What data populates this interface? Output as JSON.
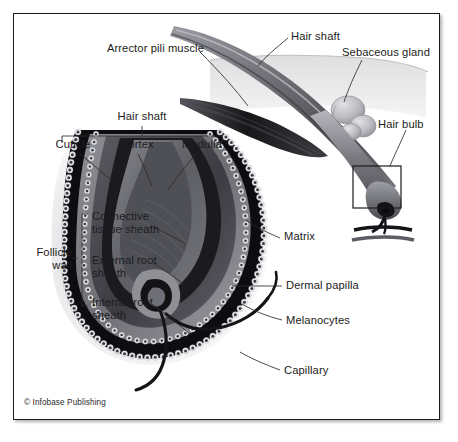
{
  "figure": {
    "credit": "© Infobase Publishing",
    "frame_color": "#1b1b1f",
    "background": "#ffffff",
    "text_color": "#1c1c20"
  },
  "labels": {
    "arrector_pili_muscle": "Arrector pili muscle",
    "hair_shaft_top": "Hair shaft",
    "sebaceous_gland": "Sebaceous gland",
    "hair_bulb": "Hair bulb",
    "hair_shaft_bracket": "Hair shaft",
    "cuticle": "Cuticle",
    "cortex": "Cortex",
    "medulla": "Medulla",
    "matrix": "Matrix",
    "dermal_papilla": "Dermal papilla",
    "melanocytes": "Melanocytes",
    "capillary": "Capillary",
    "follicle_wall": "Follicle\nwall",
    "connective_tissue_sheath": "Connective\ntissue sheath",
    "external_root_sheath": "External root\nsheath",
    "internal_root_sheath": "Internal root\nsheath"
  },
  "colors": {
    "line": "#2a2a2e",
    "skin_surface": "#dcdcdc",
    "shaft_dark": "#4e4e54",
    "shaft_mid": "#7b7b82",
    "shaft_light": "#a9a9b0",
    "muscle_dark": "#1e1e22",
    "sheath_black": "#0d0d10",
    "cell_dot": "#3a3a40",
    "cell_ring": "#e9e9ec",
    "papilla": "#8a8a91",
    "capillary": "#17171a",
    "halo": "#e6e6e8"
  },
  "structures": [
    {
      "name": "hair-shaft",
      "region": "upper-right"
    },
    {
      "name": "skin-surface",
      "region": "upper-right"
    },
    {
      "name": "arrector-pili-muscle",
      "region": "upper-middle"
    },
    {
      "name": "sebaceous-gland",
      "region": "upper-right"
    },
    {
      "name": "hair-bulb-inset-box",
      "region": "right"
    },
    {
      "name": "follicle-cross-section",
      "region": "lower-left"
    },
    {
      "name": "dermal-papilla",
      "region": "lower-center"
    },
    {
      "name": "capillary-vessel",
      "region": "lower-center"
    },
    {
      "name": "melanocyte-cells",
      "region": "lower-center"
    }
  ]
}
